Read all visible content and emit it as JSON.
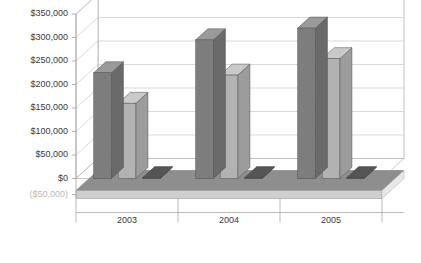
{
  "chart_data": {
    "type": "bar",
    "title": "",
    "subtitle": "",
    "xlabel": "",
    "ylabel": "",
    "categories": [
      "2003",
      "2004",
      "2005"
    ],
    "series": [
      {
        "name": "series-1",
        "color": "#7d7d7d",
        "values": [
          225000,
          295000,
          320000
        ]
      },
      {
        "name": "series-2",
        "color": "#b2b2b2",
        "values": [
          160000,
          220000,
          255000
        ]
      },
      {
        "name": "series-3",
        "color": "#3a3a3a",
        "values": [
          2000,
          2000,
          2000
        ]
      }
    ],
    "ylim": [
      -50000,
      350000
    ],
    "ytick_values": [
      350000,
      300000,
      250000,
      200000,
      150000,
      100000,
      50000,
      0,
      -50000
    ],
    "ytick_labels": [
      "$350,000",
      "$300,000",
      "$250,000",
      "$200,000",
      "$150,000",
      "$100,000",
      "$50,000",
      "$0",
      "($50,000)"
    ],
    "grid": true,
    "legend": "none",
    "three_d": true,
    "annotations": []
  },
  "colors": {
    "background": "#ffffff",
    "axis_line": "#a8a8a8",
    "grid_line": "#c9c9c9",
    "tick_text": "#3a3a3a",
    "negative_tick_text": "#b9b9b9",
    "floor_top": "#8e8e8e",
    "floor_front": "#cfcfcf",
    "wall": "#ffffff",
    "series_1_front": "#7d7d7d",
    "series_1_side": "#6a6a6a",
    "series_1_top": "#9a9a9a",
    "series_2_front": "#b2b2b2",
    "series_2_side": "#9c9c9c",
    "series_2_top": "#c9c9c9",
    "series_3_front": "#3a3a3a",
    "series_3_side": "#2b2b2b",
    "series_3_top": "#555555"
  }
}
